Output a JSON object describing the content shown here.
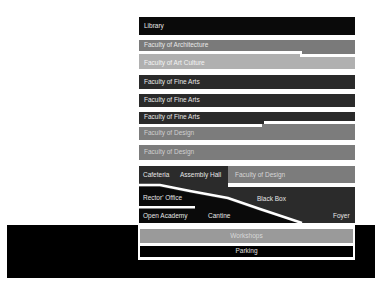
{
  "diagram": {
    "colors": {
      "black": "#0a0a0a",
      "dark_gray": "#2b2b2b",
      "mid_gray": "#7b7b7b",
      "light_gray": "#b0b0b0",
      "workshops_gray": "#9a9a9a",
      "white": "#ffffff"
    },
    "floors": [
      {
        "label": "Library"
      },
      {
        "label": "Faculty of Architecture"
      },
      {
        "label": "Faculty of Art Culture"
      },
      {
        "label": "Faculty of Fine Arts"
      },
      {
        "label": "Faculty of Fine Arts"
      },
      {
        "label": "Faculty of Fine Arts"
      },
      {
        "label": "Faculty of Design"
      },
      {
        "label": "Faculty of Design"
      }
    ],
    "ground_block": {
      "cafeteria": "Cafeteria",
      "assembly_hall": "Assembly Hall",
      "faculty_of_design": "Faculty of Design",
      "rectors_office": "Rector' Office",
      "black_box": "Black Box",
      "open_academy": "Open Academy",
      "cantine": "Cantine",
      "foyer": "Foyer"
    },
    "basement": {
      "workshops": "Workshops",
      "parking": "Parking"
    }
  }
}
